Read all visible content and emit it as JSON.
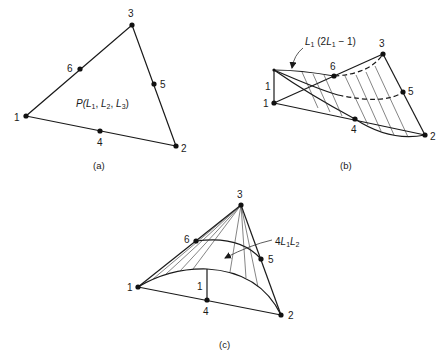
{
  "figure": {
    "panels": [
      {
        "id": "a",
        "caption": "(a)",
        "description": "Six-node triangular element with area coordinates",
        "nodes": [
          "1",
          "2",
          "3",
          "4",
          "5",
          "6"
        ],
        "point_label": {
          "prefix": "P(",
          "L": "L",
          "s1": "1",
          "sep1": ", ",
          "s2": "2",
          "sep2": ", ",
          "s3": "3",
          "suffix": ")"
        }
      },
      {
        "id": "b",
        "caption": "(b)",
        "description": "Shape function for corner node 1",
        "nodes": [
          "1",
          "2",
          "3",
          "4",
          "5",
          "6"
        ],
        "height_label": "1",
        "function_label": {
          "L": "L",
          "sub": "1",
          "mid": " (2",
          "L2": "L",
          "sub2": "1",
          "tail": " − 1)"
        }
      },
      {
        "id": "c",
        "caption": "(c)",
        "description": "Shape function for mid-side node 4",
        "nodes": [
          "1",
          "2",
          "3",
          "4",
          "5",
          "6"
        ],
        "height_label": "1",
        "function_label": {
          "coef": "4",
          "L1": "L",
          "sub1": "1",
          "L2": "L",
          "sub2": "2"
        }
      }
    ]
  }
}
